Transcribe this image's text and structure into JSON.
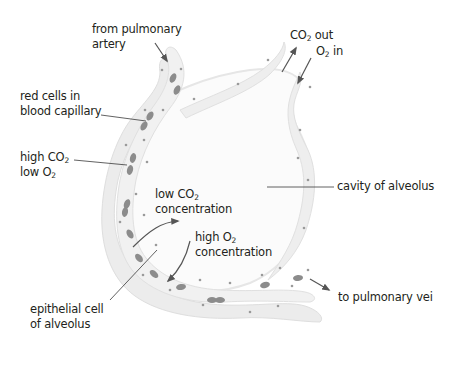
{
  "diagram": {
    "labels": {
      "from_pulmonary_artery": {
        "line1": "from pulmonary",
        "line2": "artery"
      },
      "red_cells": {
        "line1": "red cells in",
        "line2": "blood capillary"
      },
      "high_co2": {
        "prefix": "high CO",
        "sub": "2"
      },
      "low_o2": {
        "prefix": "low O",
        "sub": "2"
      },
      "low_co2_conc": {
        "prefix": "low CO",
        "sub": "2",
        "line2": "concentration"
      },
      "high_o2_conc": {
        "prefix": "high O",
        "sub": "2",
        "line2": "concentration"
      },
      "epithelial": {
        "line1": "epithelial cell",
        "line2": "of alveolus"
      },
      "cavity": "cavity of alveolus",
      "co2_out": {
        "prefix": "CO",
        "sub": "2",
        "suffix": " out"
      },
      "o2_in": {
        "prefix": "O",
        "sub": "2",
        "suffix": " in"
      },
      "to_pulmonary_vein": "to pulmonary vei"
    },
    "colors": {
      "tissue_fill": "#ececec",
      "tissue_edge": "#dcdcdc",
      "red_cell": "#8c8c8c",
      "nucleus": "#9a9a9a",
      "arrow": "#555555",
      "leader_line": "#3a3a3a",
      "text": "#231f20"
    }
  }
}
